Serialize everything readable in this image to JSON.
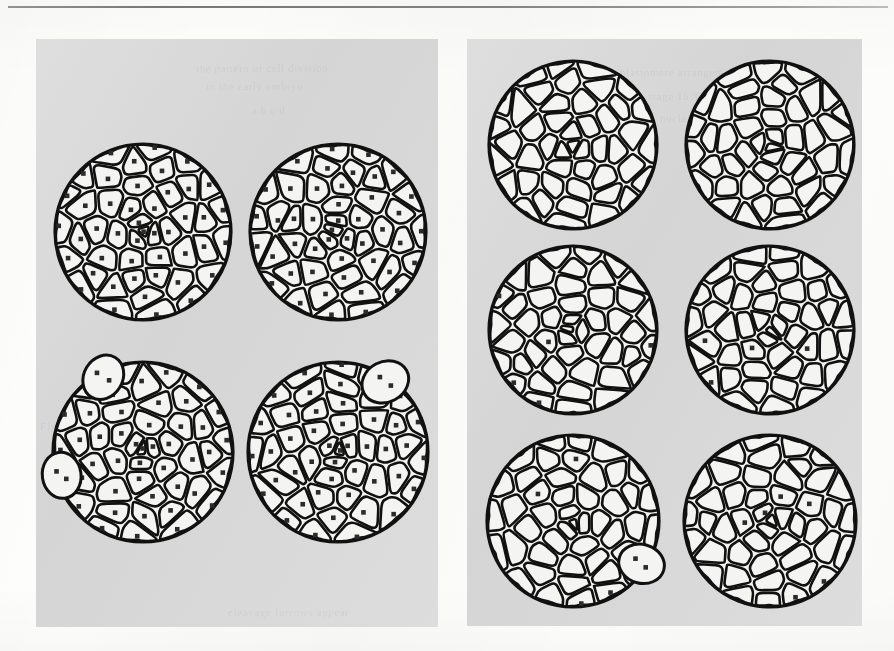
{
  "figure": {
    "kind": "scanned-figure",
    "page_background": "#fdfdfc",
    "panel_background": "#d9d9d9",
    "ink_color": "#111111",
    "cell_fill": "#f4f4f2",
    "nucleus_color": "#2b2b2b",
    "top_rule_color": "#7d7d7d"
  },
  "panels": [
    {
      "id": "panel-left",
      "name": "left-plate",
      "x": 36,
      "y": 39,
      "width": 402,
      "height": 588,
      "rows": 2,
      "cols": 2,
      "circles": [
        {
          "id": "L1",
          "name": "circle-left-top-left",
          "cx": 143,
          "cy": 232,
          "r": 88,
          "seed": 1101,
          "cell_count": 46,
          "nucleus_count": 46,
          "protrusions": []
        },
        {
          "id": "L2",
          "name": "circle-left-top-right",
          "cx": 338,
          "cy": 232,
          "r": 88,
          "seed": 1202,
          "cell_count": 46,
          "nucleus_count": 46,
          "protrusions": []
        },
        {
          "id": "L3",
          "name": "circle-left-bottom-left",
          "cx": 143,
          "cy": 452,
          "r": 90,
          "seed": 1303,
          "cell_count": 46,
          "nucleus_count": 48,
          "protrusions": [
            {
              "name": "budding-cell-upper-left",
              "angle": 118,
              "rr": 22,
              "dots": 2
            },
            {
              "name": "budding-cell-lower-left",
              "angle": 196,
              "rr": 22,
              "dots": 2
            }
          ]
        },
        {
          "id": "L4",
          "name": "circle-left-bottom-right",
          "cx": 338,
          "cy": 452,
          "r": 90,
          "seed": 1404,
          "cell_count": 46,
          "nucleus_count": 47,
          "protrusions": [
            {
              "name": "budding-cell-upper-right",
              "angle": 56,
              "rr": 23,
              "dots": 2
            }
          ]
        }
      ]
    },
    {
      "id": "panel-right",
      "name": "right-plate",
      "x": 467,
      "y": 39,
      "width": 395,
      "height": 587,
      "rows": 3,
      "cols": 2,
      "circles": [
        {
          "id": "R1",
          "name": "circle-right-top-left",
          "cx": 573,
          "cy": 145,
          "r": 84,
          "seed": 2101,
          "cell_count": 40,
          "nucleus_count": 0,
          "protrusions": []
        },
        {
          "id": "R2",
          "name": "circle-right-top-right",
          "cx": 770,
          "cy": 145,
          "r": 84,
          "seed": 2202,
          "cell_count": 40,
          "nucleus_count": 0,
          "protrusions": []
        },
        {
          "id": "R3",
          "name": "circle-right-middle-left",
          "cx": 573,
          "cy": 330,
          "r": 84,
          "seed": 2303,
          "cell_count": 40,
          "nucleus_count": 5,
          "protrusions": []
        },
        {
          "id": "R4",
          "name": "circle-right-middle-right",
          "cx": 770,
          "cy": 330,
          "r": 84,
          "seed": 2404,
          "cell_count": 40,
          "nucleus_count": 4,
          "protrusions": []
        },
        {
          "id": "R5",
          "name": "circle-right-bottom-left",
          "cx": 573,
          "cy": 521,
          "r": 86,
          "seed": 2505,
          "cell_count": 40,
          "nucleus_count": 5,
          "protrusions": [
            {
              "name": "budding-cell-lower-right",
              "angle": -32,
              "rr": 22,
              "dots": 2
            }
          ]
        },
        {
          "id": "R6",
          "name": "circle-right-bottom-right",
          "cx": 770,
          "cy": 521,
          "r": 86,
          "seed": 2606,
          "cell_count": 40,
          "nucleus_count": 6,
          "protrusions": []
        }
      ]
    }
  ],
  "bleed_through": [
    {
      "text": "the pattern of cell division",
      "x": 196,
      "y": 62,
      "rot": -0.4
    },
    {
      "text": "in the early embryo",
      "x": 206,
      "y": 80,
      "rot": -0.4
    },
    {
      "text": "a b c d",
      "x": 252,
      "y": 104,
      "rot": -0.3
    },
    {
      "text": "blastomere arrangement",
      "x": 620,
      "y": 66,
      "rot": -0.3
    },
    {
      "text": "stage  16   32   64",
      "x": 648,
      "y": 90,
      "rot": -0.3
    },
    {
      "text": "nuclei counted",
      "x": 660,
      "y": 112,
      "rot": -0.3
    },
    {
      "text": "Figure 4",
      "x": 40,
      "y": 420,
      "rot": 0
    },
    {
      "text": "cleavage furrows appear",
      "x": 228,
      "y": 606,
      "rot": -0.2
    }
  ]
}
